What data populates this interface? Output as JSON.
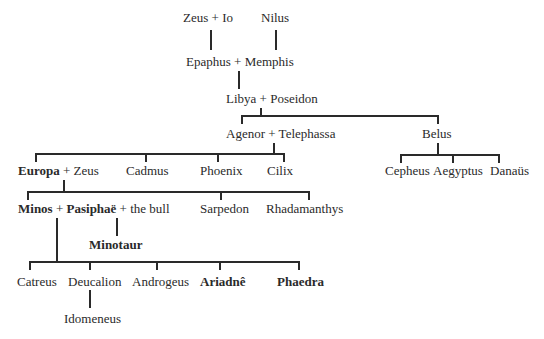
{
  "diagram": {
    "type": "family-tree",
    "generation1": {
      "zeus_io": {
        "a": "Zeus",
        "plus": "+",
        "b": "Io"
      },
      "nilus": "Nilus"
    },
    "generation2": {
      "a": "Epaphus",
      "plus": "+",
      "b": "Memphis"
    },
    "generation3": {
      "a": "Libya",
      "plus": "+",
      "b": "Poseidon"
    },
    "generation4": {
      "agenor": {
        "a": "Agenor",
        "plus": "+",
        "b": "Telephassa"
      },
      "belus": "Belus"
    },
    "generation5": {
      "europa": {
        "a": "Europa",
        "plus": "+",
        "b": "Zeus"
      },
      "cadmus": "Cadmus",
      "phoenix": "Phoenix",
      "cilix": "Cilix",
      "cepheus": "Cepheus",
      "aegyptus": "Aegyptus",
      "danaus": "Danaüs"
    },
    "generation6": {
      "minos": {
        "a": "Minos",
        "plus1": "+",
        "b": "Pasiphaë",
        "plus2": "+",
        "c": "the bull"
      },
      "sarpedon": "Sarpedon",
      "rhadamanthys": "Rhadamanthys"
    },
    "minotaur": "Minotaur",
    "generation7": {
      "catreus": "Catreus",
      "deucalion": "Deucalion",
      "androgeus": "Androgeus",
      "ariadne": "Ariadnê",
      "phaedra": "Phaedra"
    },
    "idomeneus": "Idomeneus"
  }
}
